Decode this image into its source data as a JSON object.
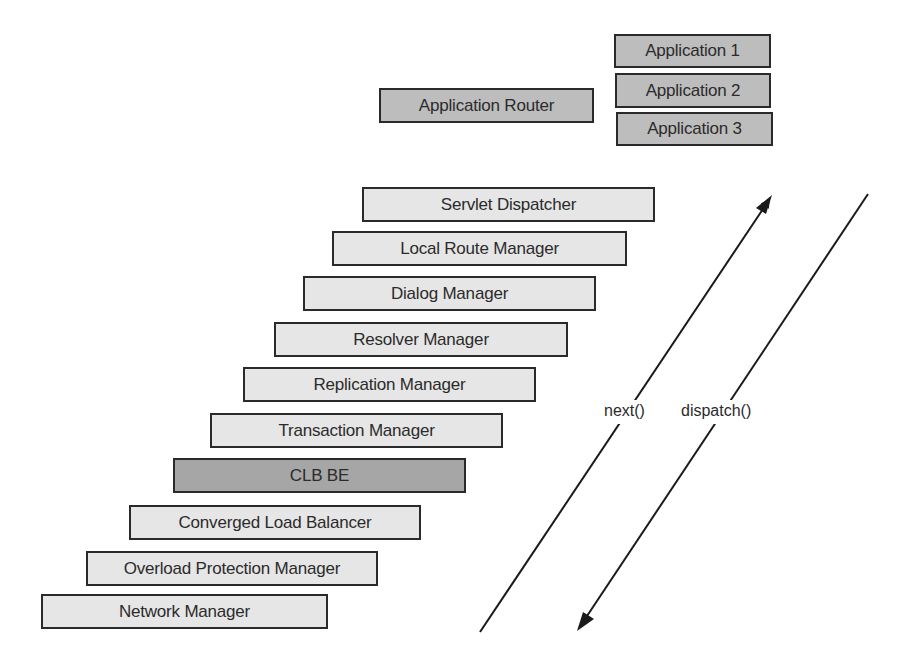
{
  "diagram": {
    "applications": [
      {
        "label": "Application 1"
      },
      {
        "label": "Application 2"
      },
      {
        "label": "Application 3"
      }
    ],
    "app_router": {
      "label": "Application Router"
    },
    "stack": [
      {
        "label": "Servlet Dispatcher"
      },
      {
        "label": "Local Route Manager"
      },
      {
        "label": "Dialog Manager"
      },
      {
        "label": "Resolver Manager"
      },
      {
        "label": "Replication Manager"
      },
      {
        "label": "Transaction Manager"
      },
      {
        "label": "CLB BE"
      },
      {
        "label": "Converged Load Balancer"
      },
      {
        "label": "Overload Protection Manager"
      },
      {
        "label": "Network Manager"
      }
    ],
    "arrows": {
      "next": {
        "label": "next()",
        "direction": "up"
      },
      "dispatch": {
        "label": "dispatch()",
        "direction": "down"
      }
    },
    "colors": {
      "light_box": "#e6e6e6",
      "app_box": "#bdbdbd",
      "highlight_box": "#a6a6a6",
      "border": "#2a2a2a"
    }
  }
}
